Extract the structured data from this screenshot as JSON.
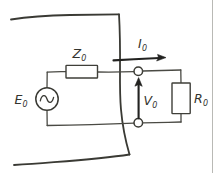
{
  "figure": {
    "background_color": "#ffffff",
    "ink_color": "#35352f",
    "border_color": "#b9b9b5"
  },
  "labels": {
    "source": {
      "base": "E",
      "sub": "0",
      "full": "E₀"
    },
    "impedance": {
      "base": "Z",
      "sub": "0",
      "full": "Z₀"
    },
    "current": {
      "base": "I",
      "sub": "0",
      "full": "I₀"
    },
    "voltage": {
      "base": "V",
      "sub": "0",
      "full": "V₀"
    },
    "load": {
      "base": "R",
      "sub": "0",
      "full": "R₀"
    }
  },
  "components": [
    {
      "name": "ac-voltage-source",
      "label": "E₀",
      "symbol": "circle-with-sine"
    },
    {
      "name": "series-impedance",
      "label": "Z₀",
      "symbol": "rectangle-horizontal"
    },
    {
      "name": "load-resistor",
      "label": "R₀",
      "symbol": "rectangle-vertical"
    },
    {
      "name": "output-terminal-top",
      "label": "",
      "symbol": "open-circle"
    },
    {
      "name": "output-terminal-bottom",
      "label": "",
      "symbol": "open-circle"
    }
  ],
  "annotations": [
    {
      "name": "current-arrow",
      "label": "I₀",
      "direction": "right"
    },
    {
      "name": "voltage-arrow",
      "label": "V₀",
      "direction": "up"
    }
  ]
}
